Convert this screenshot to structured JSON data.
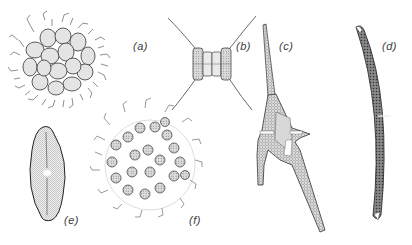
{
  "figure": {
    "background": "#ffffff",
    "ink_color": "#2a2a2a",
    "organisms": [
      {
        "id": "a",
        "label": "(a)",
        "description": "spherical colony with tangled filaments",
        "label_pos": [
          133,
          47
        ]
      },
      {
        "id": "b",
        "label": "(b)",
        "description": "chain diatom with long curved setae",
        "label_pos": [
          236,
          47
        ]
      },
      {
        "id": "c",
        "label": "(c)",
        "description": "horned dinoflagellate with three long horns",
        "label_pos": [
          279,
          47
        ]
      },
      {
        "id": "d",
        "label": "(d)",
        "description": "crescent-shaped desmid",
        "label_pos": [
          382,
          47
        ]
      },
      {
        "id": "e",
        "label": "(e)",
        "description": "lanceolate pennate diatom with central raphe",
        "label_pos": [
          65,
          222
        ]
      },
      {
        "id": "f",
        "label": "(f)",
        "description": "loose spherical colony of spiny cells",
        "label_pos": [
          189,
          222
        ]
      }
    ]
  }
}
